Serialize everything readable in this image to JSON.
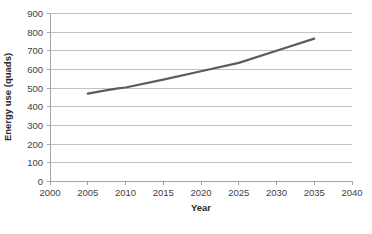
{
  "chart_data": {
    "type": "line",
    "title": "",
    "xlabel": "Year",
    "ylabel": "Energy use (quads)",
    "xlim": [
      2000,
      2040
    ],
    "ylim": [
      0,
      900
    ],
    "xticks": [
      2000,
      2005,
      2010,
      2015,
      2020,
      2025,
      2030,
      2035,
      2040
    ],
    "yticks": [
      0,
      100,
      200,
      300,
      400,
      500,
      600,
      700,
      800,
      900
    ],
    "grid": "horizontal",
    "legend": "none",
    "series": [
      {
        "name": "Energy use",
        "color": "#5c5c5c",
        "x": [
          2005,
          2007,
          2009,
          2010,
          2015,
          2020,
          2025,
          2030,
          2035
        ],
        "values": [
          470,
          485,
          498,
          503,
          545,
          590,
          635,
          700,
          765
        ]
      }
    ]
  },
  "axis": {
    "x_title": "Year",
    "y_title": "Energy use (quads)",
    "x_tick_labels": [
      "2000",
      "2005",
      "2010",
      "2015",
      "2020",
      "2025",
      "2030",
      "2035",
      "2040"
    ],
    "y_tick_labels": [
      "0",
      "100",
      "200",
      "300",
      "400",
      "500",
      "600",
      "700",
      "800",
      "900"
    ]
  },
  "colors": {
    "series": "#5c5c5c",
    "gridline": "#b4b4b4",
    "axis": "#9a9a9a",
    "text": "#3f3f3f",
    "background": "#ffffff"
  }
}
